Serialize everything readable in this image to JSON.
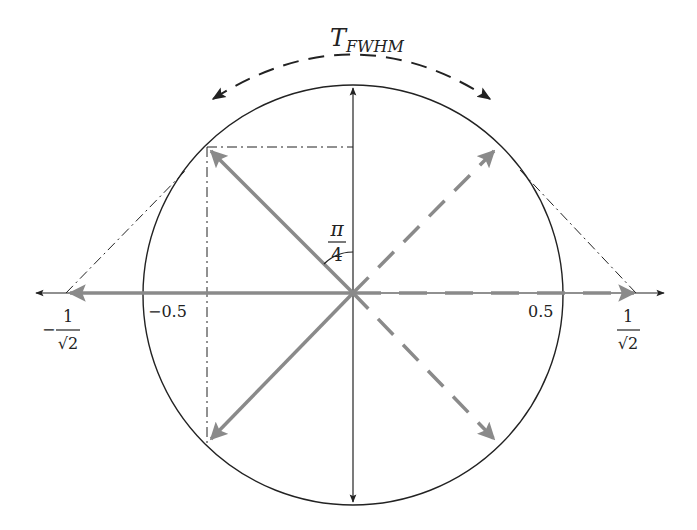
{
  "diagram": {
    "title_label": "T",
    "title_subscript": "FWHM",
    "angle_label": {
      "numerator": "π",
      "denominator": "4"
    },
    "axis_ticks": {
      "neg_half": "−0.5",
      "pos_half": "0.5",
      "neg_inv_sqrt2": {
        "sign": "−",
        "numerator": "1",
        "denominator": "√2"
      },
      "pos_inv_sqrt2": {
        "numerator": "1",
        "denominator": "√2"
      }
    },
    "colors": {
      "line": "#222222",
      "vector": "#8a8a8a",
      "background": "#ffffff"
    },
    "elements": [
      "unit circle (radius 0.5)",
      "horizontal axis with arrows both ends",
      "vertical double-headed arrow (diameter)",
      "solid gray vectors at 135° and 225° and 180°",
      "dashed gray vectors at 45°, 315° and 0°",
      "dash-dot projection lines from 135° point",
      "dash-dot tangent lines to ±1/√2",
      "dashed arc arrow labeled T_FWHM",
      "angle arc π/4 between vertical and 135° vector"
    ]
  }
}
